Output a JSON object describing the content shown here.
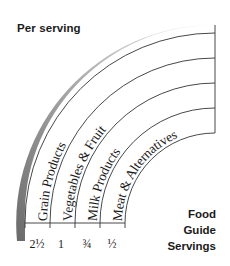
{
  "header": {
    "title": "Per serving"
  },
  "legend": {
    "lines": [
      "Food",
      "Guide",
      "Servings"
    ]
  },
  "bands": [
    {
      "label": "Grain Products",
      "servings": "2½"
    },
    {
      "label": "Vegetables & Fruit",
      "servings": "1"
    },
    {
      "label": "Milk Products",
      "servings": "¾"
    },
    {
      "label": "Meat & Alternatives",
      "servings": "½"
    }
  ],
  "colors": {
    "line": "#333333",
    "shadow_dark": "#6e6e6e",
    "shadow_light": "#e6e6e6",
    "text": "#1a1a1a"
  }
}
